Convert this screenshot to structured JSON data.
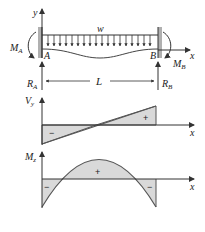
{
  "beam": {
    "load_label": "w",
    "y_axis_label": "y",
    "x_axis_label": "x",
    "left_end_label": "A",
    "right_end_label": "B",
    "left_moment_label": "M",
    "left_moment_sub": "A",
    "right_moment_label": "M",
    "right_moment_sub": "B",
    "left_reaction_label": "R",
    "left_reaction_sub": "A",
    "right_reaction_label": "R",
    "right_reaction_sub": "B",
    "length_label": "L"
  },
  "shear_diagram": {
    "y_label": "V",
    "y_sub": "y",
    "x_label": "x",
    "positive_sign": "+",
    "negative_sign": "−"
  },
  "moment_diagram": {
    "y_label": "M",
    "y_sub": "z",
    "x_label": "x",
    "positive_sign": "+",
    "left_negative_sign": "−",
    "right_negative_sign": "−"
  },
  "colors": {
    "line": "#444444",
    "fill": "#d9d9d9",
    "wall": "#b0b0b0"
  }
}
